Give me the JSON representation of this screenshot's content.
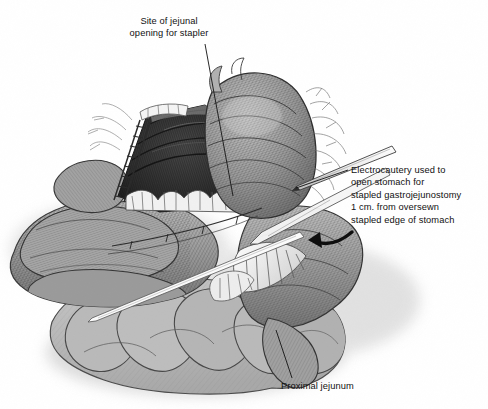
{
  "figure": {
    "kind": "medical-illustration",
    "background_color": "#ffffff",
    "ink_color": "#111111",
    "width": 488,
    "height": 409
  },
  "annotations": [
    {
      "id": "jejunal-opening",
      "text": "Site of jejunal\nopening for stapler",
      "align": "center"
    },
    {
      "id": "electrocautery",
      "text": "Electrocautery used to\nopen stomach for\nstapled gastrojejunostomy\n1 cm. from oversewn\nstapled edge of stomach",
      "align": "left"
    },
    {
      "id": "proximal-jejunum",
      "text": "Proximal jejunum",
      "align": "left"
    }
  ],
  "structures": [
    {
      "name": "gastric-pouch",
      "tone": "#8d8d8d"
    },
    {
      "name": "open-cavity",
      "tone": "#2c2c2c"
    },
    {
      "name": "stapled-edge-left",
      "tone": "#6f6f6f"
    },
    {
      "name": "stapled-edge-right",
      "tone": "#6f6f6f"
    },
    {
      "name": "jejunal-limb",
      "tone": "#949494"
    },
    {
      "name": "small-bowel-loops",
      "tone": "#9a9a9a"
    },
    {
      "name": "transverse-colon",
      "tone": "#b4b4b4"
    },
    {
      "name": "mesentery-fan",
      "tone": "#e8e8e8"
    },
    {
      "name": "electrocautery-instrument",
      "tone": "#f2f2f2"
    },
    {
      "name": "suture-line",
      "tone": "#3a3a3a"
    },
    {
      "name": "drop-shadow",
      "tone": "#c9c9c9"
    }
  ],
  "palette": {
    "paper": "#ffffff",
    "ink": "#111111",
    "cavity_dark": "#2c2c2c",
    "tissue_mid": "#909090",
    "colon_light": "#b6b6b6",
    "highlight": "#f4f4f4"
  }
}
